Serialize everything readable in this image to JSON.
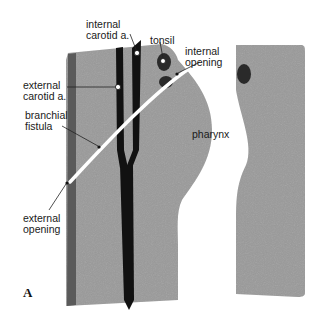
{
  "figure": {
    "panel_letter": "A",
    "labels": {
      "internal_carotid_line1": "internal",
      "internal_carotid_line2": "carotid a.",
      "tonsil": "tonsil",
      "internal_opening_line1": "internal",
      "internal_opening_line2": "opening",
      "external_carotid_line1": "external",
      "external_carotid_line2": "carotid a.",
      "branchial_fistula_line1": "branchial",
      "branchial_fistula_line2": "fistula",
      "pharynx": "pharynx",
      "external_opening_line1": "external",
      "external_opening_line2": "opening"
    },
    "colors": {
      "tissue": "#9a9a9a",
      "skin_edge": "#555555",
      "artery": "#111111",
      "tonsil": "#2a2a2a",
      "fistula": "#ffffff",
      "background": "#ffffff"
    }
  }
}
